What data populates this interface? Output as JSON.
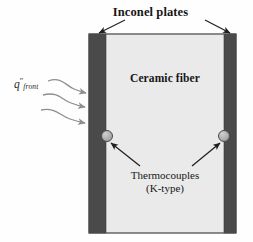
{
  "figure": {
    "title": "Inconel plates",
    "core_label": "Ceramic fiber",
    "heat_flux_symbol": "q",
    "heat_flux_prime": "″",
    "heat_flux_subscript": "front",
    "sensor_label_line1": "Thermocouples",
    "sensor_label_line2": "(K-type)"
  },
  "colors": {
    "plate_fill": "#4a4a4a",
    "core_fill": "#eaeaea",
    "background": "#fefefe",
    "outline": "#3a3a3a",
    "arrow_dark": "#1f1f1f",
    "flux_arrow": "#8e8e8e",
    "thermocouple_fill": "#a9a9a9",
    "thermocouple_stroke": "#4a4a4a",
    "text": "#161616"
  },
  "geometry": {
    "specimen_left": 89,
    "specimen_right": 236,
    "specimen_top": 34,
    "specimen_bottom": 233,
    "left_plate_width": 17,
    "right_plate_width": 12,
    "thermocouple_left_x": 107,
    "thermocouple_right_x": 224,
    "thermocouple_y": 136,
    "thermocouple_radius": 5.5,
    "flux_arrow_count": 3
  }
}
